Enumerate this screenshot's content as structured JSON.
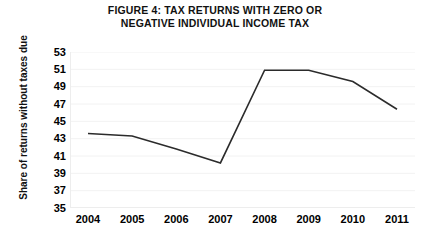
{
  "figure": {
    "title_line1": "FIGURE 4: TAX RETURNS WITH ZERO OR",
    "title_line2": "NEGATIVE INDIVIDUAL INCOME TAX",
    "background_color": "#ffffff",
    "line_color": "#2b2b2b",
    "gridline_color": "#f2f2f2",
    "axis_color": "#ededed",
    "text_color": "#000000"
  },
  "chart_data": {
    "type": "line",
    "title": "FIGURE 4: TAX RETURNS WITH ZERO OR NEGATIVE INDIVIDUAL INCOME TAX",
    "xlabel": "",
    "ylabel": "Share of returns without taxes due",
    "categories": [
      "2004",
      "2005",
      "2006",
      "2007",
      "2008",
      "2009",
      "2010",
      "2011"
    ],
    "values": [
      43.6,
      43.3,
      41.8,
      40.2,
      50.9,
      50.9,
      49.6,
      46.4
    ],
    "series": [
      {
        "name": "Share of returns without taxes due",
        "values": [
          43.6,
          43.3,
          41.8,
          40.2,
          50.9,
          50.9,
          49.6,
          46.4
        ]
      }
    ],
    "ylim": [
      35,
      53
    ],
    "ytick_labels": [
      "53",
      "51",
      "49",
      "47",
      "45",
      "43",
      "41",
      "39",
      "37",
      "35"
    ],
    "ytick_values": [
      53,
      51,
      49,
      47,
      45,
      43,
      41,
      39,
      37,
      35
    ],
    "xtick_labels": [
      "2004",
      "2005",
      "2006",
      "2007",
      "2008",
      "2009",
      "2010",
      "2011"
    ],
    "grid": true,
    "legend": "none",
    "markers": "none"
  }
}
